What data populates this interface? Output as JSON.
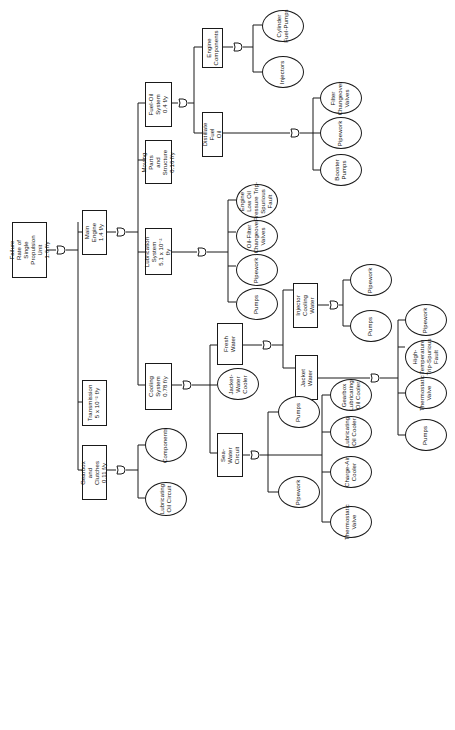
{
  "diagram": {
    "type": "fault-tree",
    "orientation": "rotated-90-ccw",
    "root": {
      "label": "Failure Rate of\nSingle Propulsion\nUnit\n1.6 f/y"
    },
    "events": {
      "main_engine": "Main Engine\n1.4 f/y",
      "transmission": "Transmission\n5 x 10⁻² f/y",
      "gearbox_clutches": "Gearbox and\nClutches\n0.11 f/y",
      "fuel_oil_system": "Fuel-Oil System\n0.4 f/y",
      "moving_parts": "Moving Parts and\nStructure\n0.16 f/y",
      "lubrication_system": "Lubrication System\n5.1 x 10⁻² f/y",
      "cooling_system": "Cooling System\n0.78 f/y",
      "engine_components": "Engine\nComponents",
      "distillate_fuel_oil": "Distillate Fuel\nOil",
      "fresh_water": "Fresh Water",
      "sea_water_circuit": "Sea-Water\nCircuit",
      "injector_cooling_water": "Injector Cooling\nWater",
      "jacket_water": "Jacket Water"
    },
    "basic_events": {
      "cylinder_fuel_pumps": "Cylinder\nFuel-Pumps",
      "injectors": "Injectors",
      "filter_changeover_valves_fuel": "Filter\nChangeover\nValves",
      "pipework_fuel": "Pipework",
      "booster_pumps": "Booster\nPumps",
      "engine_low_oil_pressure": "Engine\nLow Oil\nPressure Trip-\nSpurious\nFault",
      "oil_filter_changeover_valves": "Oil-Filter\nChangeover\nValves",
      "pipework_lub": "Pipework",
      "pumps_lub": "Pumps",
      "jacket_water_cooler": "Jacket-\nWater\nCooler",
      "pipework_injector": "Pipework",
      "pumps_injector": "Pumps",
      "pipework_jacket": "Pipework",
      "high_temp_trip": "High-\nTemperature\nTrip-Spurious\nFault",
      "thermostatic_valve_jacket": "Thermostatic\nValve",
      "pumps_jacket": "Pumps",
      "pumps_sea": "Pumps",
      "pipework_sea": "Pipework",
      "gearbox_lub_oil_cooler": "Gearbox\nLubricating\nOil Cooler",
      "lubricating_oil_cooler": "Lubricating\nOil Cooler",
      "charge_air_cooler": "Charge-Air\nCooler",
      "thermostatic_valve_sea": "Thermostatic\nValve",
      "components_gearbox": "Components",
      "lubricating_oil_circuit": "Lubricating\nOil Circuit"
    },
    "gate_type": "OR"
  }
}
